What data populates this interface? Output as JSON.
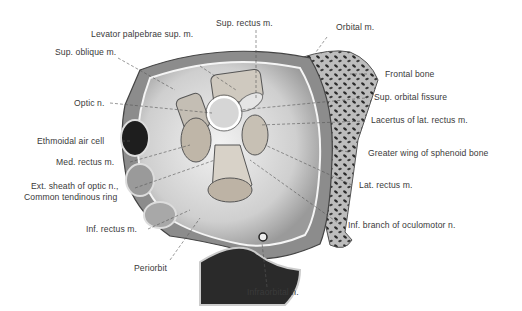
{
  "figure": {
    "labels": {
      "sup_rectus": "Sup. rectus m.",
      "levator": "Levator palpebrae sup. m.",
      "orbital_m": "Orbital m.",
      "sup_oblique": "Sup. oblique m.",
      "frontal_bone": "Frontal bone",
      "sup_orbital_fissure": "Sup. orbital fissure",
      "optic_n": "Optic n.",
      "lacertus": "Lacertus of lat. rectus m.",
      "ethmoidal": "Ethmoidal air cell",
      "greater_wing": "Greater wing of sphenoid bone",
      "med_rectus": "Med. rectus m.",
      "ext_sheath": "Ext. sheath of optic n.,",
      "common_ring": "Common tendinous ring",
      "lat_rectus": "Lat. rectus m.",
      "inf_rectus": "Inf. rectus m.",
      "inf_branch": "Inf. branch of oculomotor n.",
      "periorbit": "Periorbit",
      "infraorbital": "Infraorbital n."
    }
  }
}
